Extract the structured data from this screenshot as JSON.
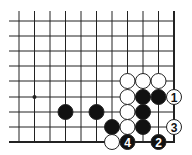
{
  "diagram": {
    "type": "go-board-fragment",
    "grid": {
      "cols_x": [
        19,
        34.5,
        50,
        65.5,
        81,
        96.5,
        112,
        127.5,
        143,
        158.5,
        174
      ],
      "rows_y": [
        21,
        36,
        51,
        66,
        81,
        97,
        112,
        127,
        142
      ],
      "left_open_x": 9,
      "top_open_y": 11,
      "right_edge_col": 10,
      "bottom_edge_row": 8,
      "line_color": "#222222"
    },
    "star_points": [
      {
        "col": 1,
        "row": 5
      }
    ],
    "stones": [
      {
        "col": 7,
        "row": 4,
        "color": "white",
        "label": ""
      },
      {
        "col": 8,
        "row": 4,
        "color": "white",
        "label": ""
      },
      {
        "col": 9,
        "row": 4,
        "color": "white",
        "label": ""
      },
      {
        "col": 7,
        "row": 5,
        "color": "white",
        "label": ""
      },
      {
        "col": 8,
        "row": 5,
        "color": "black",
        "label": ""
      },
      {
        "col": 9,
        "row": 5,
        "color": "black",
        "label": ""
      },
      {
        "col": 10,
        "row": 5,
        "color": "white",
        "label": "1"
      },
      {
        "col": 3,
        "row": 6,
        "color": "black",
        "label": ""
      },
      {
        "col": 5,
        "row": 6,
        "color": "black",
        "label": ""
      },
      {
        "col": 7,
        "row": 6,
        "color": "white",
        "label": ""
      },
      {
        "col": 8,
        "row": 6,
        "color": "black",
        "label": ""
      },
      {
        "col": 6,
        "row": 7,
        "color": "black",
        "label": ""
      },
      {
        "col": 7,
        "row": 7,
        "color": "white",
        "label": ""
      },
      {
        "col": 8,
        "row": 7,
        "color": "black",
        "label": ""
      },
      {
        "col": 10,
        "row": 7,
        "color": "white",
        "label": "3"
      },
      {
        "col": 6,
        "row": 8,
        "color": "white",
        "label": ""
      },
      {
        "col": 7,
        "row": 8,
        "color": "black",
        "label": "4"
      },
      {
        "col": 9,
        "row": 8,
        "color": "black",
        "label": "2"
      }
    ],
    "stone_radius": 7.5,
    "colors": {
      "black": "#111111",
      "white": "#ffffff",
      "outline": "#222222"
    }
  }
}
